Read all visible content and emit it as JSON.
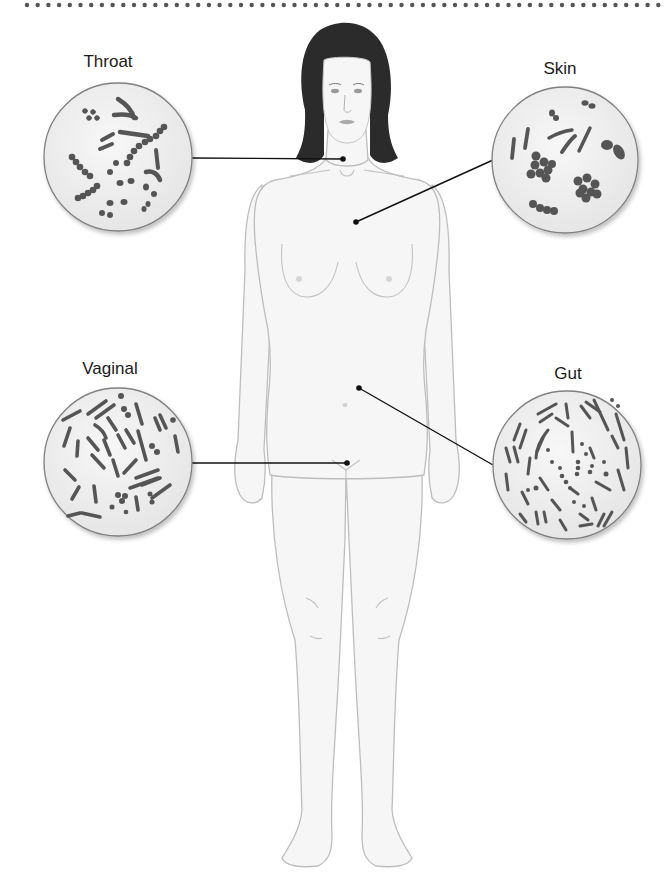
{
  "diagram": {
    "sites": [
      {
        "name": "Throat",
        "label": "Throat"
      },
      {
        "name": "Skin",
        "label": "Skin"
      },
      {
        "name": "Vaginal",
        "label": "Vaginal"
      },
      {
        "name": "Gut",
        "label": "Gut"
      }
    ]
  },
  "colors": {
    "background": "#ffffff",
    "circle_fill": "#f1f1f1",
    "circle_stroke": "#7a7a7a",
    "bacteria": "#555555",
    "body_fill": "#f5f5f5",
    "body_stroke": "#b8b8b8",
    "hair": "#2a2a2a",
    "leader_line": "#111111",
    "top_dots": "#555555"
  }
}
